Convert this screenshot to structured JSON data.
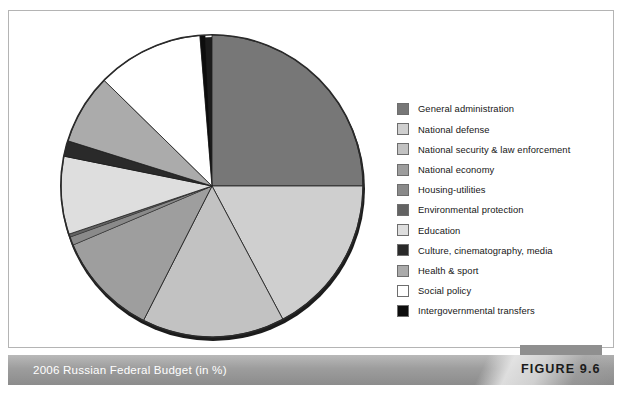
{
  "figure": {
    "caption": "2006 Russian Federal Budget (in %)",
    "number_label": "FIGURE 9.6"
  },
  "legend": {
    "position": "right",
    "items": [
      {
        "label": "General administration",
        "color": "#777777"
      },
      {
        "label": "National defense",
        "color": "#cfcfcf"
      },
      {
        "label": "National security & law enforcement",
        "color": "#c2c2c2"
      },
      {
        "label": "National economy",
        "color": "#9e9e9e"
      },
      {
        "label": "Housing-utilities",
        "color": "#8a8a8a"
      },
      {
        "label": "Environmental protection",
        "color": "#636363"
      },
      {
        "label": "Education",
        "color": "#dedede"
      },
      {
        "label": "Culture, cinematography, media",
        "color": "#2a2a2a"
      },
      {
        "label": "Health & sport",
        "color": "#ababab"
      },
      {
        "label": "Social policy",
        "color": "#ffffff"
      },
      {
        "label": "Intergovernmental transfers",
        "color": "#0d0d0d"
      }
    ]
  },
  "chart_data": {
    "type": "pie",
    "title": "2006 Russian Federal Budget (in %)",
    "units": "%",
    "start_angle_deg": 0,
    "direction": "clockwise",
    "legend_position": "right",
    "grid": false,
    "categories": [
      "General administration",
      "National defense",
      "National security & law enforcement",
      "National economy",
      "Housing-utilities",
      "Environmental protection",
      "Education",
      "Culture, cinematography, media",
      "Health & sport",
      "Social policy",
      "Intergovernmental transfers"
    ],
    "values": [
      25.0,
      17.2,
      15.3,
      11.1,
      0.9,
      0.3,
      8.3,
      1.7,
      7.5,
      11.4,
      0.6
    ],
    "colors": [
      "#777777",
      "#cfcfcf",
      "#c2c2c2",
      "#9e9e9e",
      "#8a8a8a",
      "#636363",
      "#dedede",
      "#2a2a2a",
      "#ababab",
      "#ffffff",
      "#0d0d0d"
    ],
    "slice_angles_deg": [
      90.0,
      62.0,
      55.0,
      40.0,
      3.2,
      1.2,
      30.0,
      6.0,
      27.0,
      41.0,
      2.0
    ]
  }
}
